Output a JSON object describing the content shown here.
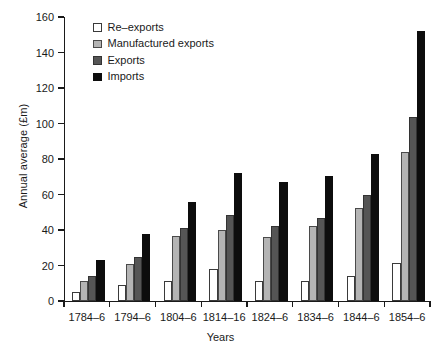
{
  "chart_data": {
    "type": "bar",
    "title": "",
    "xlabel": "Years",
    "ylabel": "Annual average (£m)",
    "ylim": [
      0,
      160
    ],
    "yticks": [
      0,
      20,
      40,
      60,
      80,
      100,
      120,
      140,
      160
    ],
    "grid": false,
    "legend_position": "top-left",
    "categories": [
      "1784–6",
      "1794–6",
      "1804–6",
      "1814–16",
      "1824–6",
      "1834–6",
      "1844–6",
      "1854–6"
    ],
    "series": [
      {
        "name": "Re–exports",
        "color": "#ffffff",
        "values": [
          5,
          9,
          11,
          18,
          11,
          11.5,
          14,
          21.5
        ]
      },
      {
        "name": "Manufactured exports",
        "color": "#b4b4b4",
        "values": [
          11,
          21,
          36.5,
          40,
          36,
          42,
          52.5,
          84
        ]
      },
      {
        "name": "Exports",
        "color": "#555555",
        "values": [
          14,
          25,
          41,
          48.5,
          42,
          46.5,
          60,
          103.5
        ]
      },
      {
        "name": "Imports",
        "color": "#0d0d0d",
        "values": [
          23,
          38,
          56,
          72,
          67,
          70.5,
          83,
          152
        ]
      }
    ]
  }
}
